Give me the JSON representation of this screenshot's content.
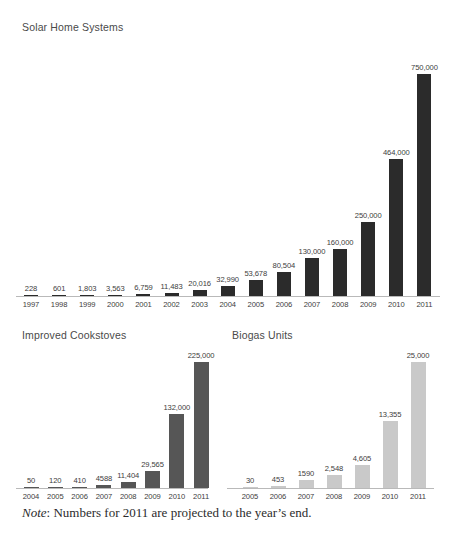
{
  "figure": {
    "note_emphasis": "Note",
    "note_separator": ": ",
    "note_text": "Numbers for 2011 are projected to the year’s end."
  },
  "colors": {
    "solar_bar": "#2b2b2b",
    "cookstove_bar": "#565656",
    "biogas_bar": "#c9c9c9",
    "axis": "#b9b9b9",
    "label_text": "#3d3d3d",
    "title_text": "#4a4a4a",
    "background": "#ffffff"
  },
  "chart_data": [
    {
      "id": "solar-home-systems",
      "type": "bar",
      "title": "Solar Home Systems",
      "xlabel": "",
      "ylabel": "",
      "grid": false,
      "legend": "none",
      "ylim": [
        0,
        750000
      ],
      "categories": [
        "1997",
        "1998",
        "1999",
        "2000",
        "2001",
        "2002",
        "2003",
        "2004",
        "2005",
        "2006",
        "2007",
        "2008",
        "2009",
        "2010",
        "2011"
      ],
      "values": [
        228,
        601,
        1803,
        3563,
        6759,
        11483,
        20016,
        32990,
        53678,
        80504,
        130000,
        160000,
        250000,
        464000,
        750000
      ],
      "value_labels": [
        "228",
        "601",
        "1,803",
        "3,563",
        "6,759",
        "11,483",
        "20,016",
        "32,990",
        "53,678",
        "80,504",
        "130,000",
        "160,000",
        "250,000",
        "464,000",
        "750,000"
      ]
    },
    {
      "id": "improved-cookstoves",
      "type": "bar",
      "title": "Improved Cookstoves",
      "xlabel": "",
      "ylabel": "",
      "grid": false,
      "legend": "none",
      "ylim": [
        0,
        225000
      ],
      "categories": [
        "2004",
        "2005",
        "2006",
        "2007",
        "2008",
        "2009",
        "2010",
        "2011"
      ],
      "values": [
        50,
        120,
        410,
        4588,
        11404,
        29565,
        132000,
        225000
      ],
      "value_labels": [
        "50",
        "120",
        "410",
        "4588",
        "11,404",
        "29,565",
        "132,000",
        "225,000"
      ]
    },
    {
      "id": "biogas-units",
      "type": "bar",
      "title": "Biogas Units",
      "xlabel": "",
      "ylabel": "",
      "grid": false,
      "legend": "none",
      "ylim": [
        0,
        25000
      ],
      "categories": [
        "2005",
        "2006",
        "2007",
        "2008",
        "2009",
        "2010",
        "2011"
      ],
      "values": [
        30,
        453,
        1590,
        2548,
        4605,
        13355,
        25000
      ],
      "value_labels": [
        "30",
        "453",
        "1590",
        "2,548",
        "4,605",
        "13,355",
        "25,000"
      ]
    }
  ]
}
